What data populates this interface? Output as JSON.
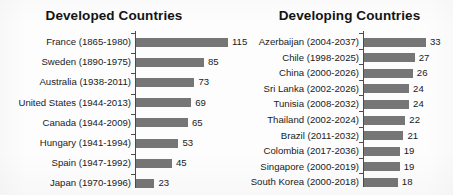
{
  "chart_data": [
    {
      "type": "bar",
      "orientation": "horizontal",
      "title": "Developed Countries",
      "xlabel": "",
      "ylabel": "",
      "grid": false,
      "legend": "none",
      "categories": [
        "France (1865-1980)",
        "Sweden (1890-1975)",
        "Australia (1938-2011)",
        "United States (1944-2013)",
        "Canada (1944-2009)",
        "Hungary (1941-1994)",
        "Spain (1947-1992)",
        "Japan (1970-1996)"
      ],
      "values": [
        115,
        85,
        73,
        69,
        65,
        53,
        45,
        23
      ],
      "value_labels": [
        "115",
        "85",
        "73",
        "69",
        "65",
        "53",
        "45",
        "23"
      ],
      "xlim": [
        0,
        115
      ]
    },
    {
      "type": "bar",
      "orientation": "horizontal",
      "title": "Developing Countries",
      "xlabel": "",
      "ylabel": "",
      "grid": false,
      "legend": "none",
      "categories": [
        "Azerbaijan (2004-2037)",
        "Chile (1998-2025)",
        "China (2000-2026)",
        "Sri Lanka (2002-2026)",
        "Tunisia (2008-2032)",
        "Thailand (2002-2024)",
        "Brazil (2011-2032)",
        "Colombia (2017-2036)",
        "Singapore (2000-2019)",
        "South Korea (2000-2018)"
      ],
      "values": [
        33,
        27,
        26,
        24,
        24,
        22,
        21,
        19,
        19,
        18
      ],
      "value_labels": [
        "33",
        "27",
        "26",
        "24",
        "24",
        "22",
        "21",
        "19",
        "19",
        "18"
      ],
      "xlim": [
        0,
        33
      ]
    }
  ],
  "panels": {
    "developed": {
      "title": "Developed Countries",
      "rows": [
        {
          "label": "France (1865-1980)",
          "value": 115,
          "value_label": "115"
        },
        {
          "label": "Sweden (1890-1975)",
          "value": 85,
          "value_label": "85"
        },
        {
          "label": "Australia (1938-2011)",
          "value": 73,
          "value_label": "73"
        },
        {
          "label": "United States (1944-2013)",
          "value": 69,
          "value_label": "69"
        },
        {
          "label": "Canada (1944-2009)",
          "value": 65,
          "value_label": "65"
        },
        {
          "label": "Hungary (1941-1994)",
          "value": 53,
          "value_label": "53"
        },
        {
          "label": "Spain (1947-1992)",
          "value": 45,
          "value_label": "45"
        },
        {
          "label": "Japan (1970-1996)",
          "value": 23,
          "value_label": "23"
        }
      ]
    },
    "developing": {
      "title": "Developing Countries",
      "rows": [
        {
          "label": "Azerbaijan (2004-2037)",
          "value": 33,
          "value_label": "33"
        },
        {
          "label": "Chile (1998-2025)",
          "value": 27,
          "value_label": "27"
        },
        {
          "label": "China (2000-2026)",
          "value": 26,
          "value_label": "26"
        },
        {
          "label": "Sri Lanka (2002-2026)",
          "value": 24,
          "value_label": "24"
        },
        {
          "label": "Tunisia (2008-2032)",
          "value": 24,
          "value_label": "24"
        },
        {
          "label": "Thailand (2002-2024)",
          "value": 22,
          "value_label": "22"
        },
        {
          "label": "Brazil (2011-2032)",
          "value": 21,
          "value_label": "21"
        },
        {
          "label": "Colombia (2017-2036)",
          "value": 19,
          "value_label": "19"
        },
        {
          "label": "Singapore (2000-2019)",
          "value": 19,
          "value_label": "19"
        },
        {
          "label": "South Korea (2000-2018)",
          "value": 18,
          "value_label": "18"
        }
      ]
    }
  },
  "style": {
    "bar_color": "#767676",
    "axis_color": "#4c4c4c",
    "text_color": "#1b1b1b",
    "title_color": "#131313",
    "background": "#fdfdfd"
  }
}
